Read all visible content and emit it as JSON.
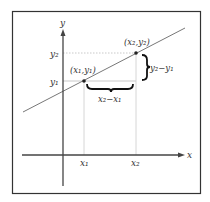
{
  "diagram": {
    "axes": {
      "x_label": "x",
      "y_label": "y"
    },
    "points": [
      {
        "name": "P1",
        "label": "(x₁,y₁)"
      },
      {
        "name": "P2",
        "label": "(x₂,y₂)"
      }
    ],
    "ticks": {
      "x1": "x₁",
      "x2": "x₂",
      "y1": "y₁",
      "y2": "y₂"
    },
    "differences": {
      "rise": "y₂−y₁",
      "run": "x₂−x₁"
    },
    "colors": {
      "frame": "#333333",
      "axes": "#444444",
      "line": "#777777",
      "guides": "#bbbbbb",
      "point": "#222222",
      "brace": "#111111"
    }
  }
}
